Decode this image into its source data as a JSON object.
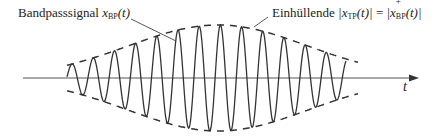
{
  "labels": {
    "bandpass_name": "Bandpasssignal",
    "bandpass_symbol": "x",
    "bandpass_sub": "BP",
    "bandpass_arg": "(t)",
    "envelope_name": "Einhüllende",
    "envelope_lhs_bar": "|",
    "envelope_lhs_symbol": "x",
    "envelope_lhs_sub": "TP",
    "envelope_lhs_arg": "(t)|",
    "envelope_eq": "=",
    "envelope_rhs_bar": "|",
    "envelope_rhs_symbol": "x",
    "envelope_rhs_sup": "+",
    "envelope_rhs_sub": "BP",
    "envelope_rhs_arg": "(t)|",
    "axis_t": "t"
  },
  "colors": {
    "line": "#333333",
    "axis": "#555555",
    "text": "#222222"
  },
  "signal": {
    "x_start": 67,
    "x_end": 346,
    "period": 21.2,
    "center_x": 218,
    "axis_y": 78,
    "max_amplitude": 53,
    "envelope_sigma": 150
  }
}
